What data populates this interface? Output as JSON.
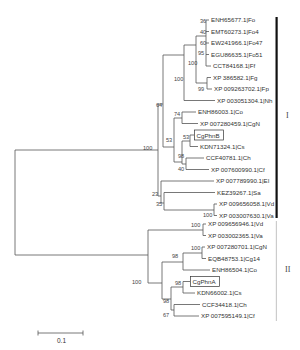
{
  "figure": {
    "type": "phylogenetic-tree",
    "scale_bar": {
      "label": "0.1"
    },
    "clades": [
      {
        "label": "I",
        "bar_color": "#111111"
      },
      {
        "label": "II",
        "bar_color": "#cccccc"
      }
    ]
  },
  "leaves": [
    {
      "id": "l0",
      "label": "ENH65677.1|Fo",
      "y": 20
    },
    {
      "id": "l1",
      "label": "EMT60273.1|Fo4",
      "y": 31.5
    },
    {
      "id": "l2",
      "label": "EW241966.1|Fo47",
      "y": 43
    },
    {
      "id": "l3",
      "label": "EGU86635.1|Fo51",
      "y": 54.5
    },
    {
      "id": "l4",
      "label": "CCT84168.1|Ff",
      "y": 66
    },
    {
      "id": "l5",
      "label": "XP 386582.1|Fg",
      "y": 77.5
    },
    {
      "id": "l6",
      "label": "XP 009263702.1|Fp",
      "y": 89
    },
    {
      "id": "l7",
      "label": "XP 003051304.1|Nh",
      "y": 100.5
    },
    {
      "id": "l8",
      "label": "ENH86003.1|Co",
      "y": 112
    },
    {
      "id": "l9",
      "label": "XP 007280459.1|CgN",
      "y": 123.5
    },
    {
      "id": "l10",
      "label": "CgPhnB",
      "y": 135,
      "boxed": true
    },
    {
      "id": "l11",
      "label": "KDN71324.1|Cs",
      "y": 146.5
    },
    {
      "id": "l12",
      "label": "CCF40781.1|Ch",
      "y": 158
    },
    {
      "id": "l13",
      "label": "XP 007600990.1|Cf",
      "y": 169.5
    },
    {
      "id": "l14",
      "label": "XP 007789990.1|EI",
      "y": 181
    },
    {
      "id": "l15",
      "label": "KEZ39267.1|Sa",
      "y": 192.5
    },
    {
      "id": "l16",
      "label": "XP 009656058.1|Vd",
      "y": 204
    },
    {
      "id": "l17",
      "label": "XP 003007630.1|Va",
      "y": 215.5
    },
    {
      "id": "l18",
      "label": "XP 009656946.1|Vd",
      "y": 224
    },
    {
      "id": "l19",
      "label": "XP 003002365.1|Va",
      "y": 235.5
    },
    {
      "id": "l20",
      "label": "XP 007280701.1|CgN",
      "y": 247
    },
    {
      "id": "l21",
      "label": "EQB48753.1|Cg14",
      "y": 258.5
    },
    {
      "id": "l22",
      "label": "ENH86504.1|Co",
      "y": 270
    },
    {
      "id": "l23",
      "label": "CgPhnA",
      "y": 281.5,
      "boxed": true
    },
    {
      "id": "l24",
      "label": "KDN66002.1|Cs",
      "y": 293
    },
    {
      "id": "l25",
      "label": "CCF34418.1|Ch",
      "y": 304.5
    },
    {
      "id": "l26",
      "label": "XP 007595149.1|Cf",
      "y": 316
    }
  ],
  "bootstrap": {
    "n_fo": "36",
    "n_fo4": "40",
    "n_fo47": "60",
    "n_fo51": "95",
    "n_fusarium": "100",
    "n_fgfp": "99",
    "n_nectria": "100",
    "n_cladeA": "64",
    "n_co": "74",
    "n_cgphnb": "53",
    "n_colleto": "53",
    "n_chcf": "98",
    "n_cf": "40",
    "n_rootI": "100",
    "n_ei": "23",
    "n_sa": "35",
    "n_v1": "100",
    "n_v2": "100",
    "n_cgn2": "100",
    "n_colleII": "98",
    "n_cgphna": "98",
    "n_chcf2": "98",
    "n_cf2": "67",
    "n_rootII": "100"
  }
}
